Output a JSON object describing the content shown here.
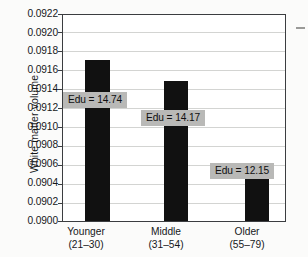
{
  "chart_data": {
    "type": "bar",
    "title": "",
    "xlabel": "",
    "ylabel": "White matter volume",
    "categories": [
      "Younger",
      "Middle",
      "Older"
    ],
    "category_ranges": [
      "(21–30)",
      "(31–54)",
      "(55–79)"
    ],
    "category_labels": [
      "Younger\n(21–30)",
      "Middle\n(31–54)",
      "Older\n(55–79)"
    ],
    "values": [
      0.09172,
      0.09149,
      0.0906
    ],
    "ylim": [
      0.09,
      0.0922
    ],
    "ytick_step": 0.0002,
    "ytick_labels": [
      "0.0922",
      "0.0920",
      "0.0918",
      "0.0916",
      "0.0914",
      "0.0912",
      "0.0910",
      "0.0908",
      "0.0906",
      "0.0904",
      "0.0902",
      "0.0900"
    ],
    "ytick_values": [
      0.0922,
      0.092,
      0.0918,
      0.0916,
      0.0914,
      0.0912,
      0.091,
      0.0908,
      0.0906,
      0.0904,
      0.0902,
      0.09
    ],
    "grid": true,
    "grid_axis": "y",
    "legend": false,
    "annotations": [
      {
        "label": "Edu = 14.74",
        "value": 14.74,
        "category": "Younger"
      },
      {
        "label": "Edu = 14.17",
        "value": 14.17,
        "category": "Middle"
      },
      {
        "label": "Edu = 12.15",
        "value": 12.15,
        "category": "Older"
      }
    ],
    "bar_color": "#111111",
    "annotation_bg_color": "#b9b9b7",
    "grid_color": "#d3d4d2",
    "axis_color": "#3b3d40"
  }
}
